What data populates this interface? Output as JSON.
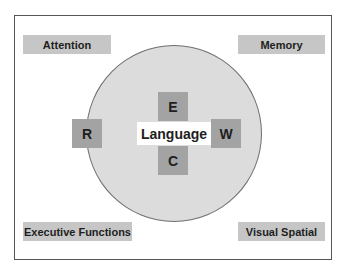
{
  "diagram": {
    "center": {
      "label": "Language"
    },
    "inner_boxes": {
      "top": "E",
      "left": "R",
      "right": "W",
      "bottom": "C"
    },
    "corners": {
      "top_left": "Attention",
      "top_right": "Memory",
      "bottom_left": "Executive Functions",
      "bottom_right": "Visual Spatial"
    },
    "colors": {
      "frame_border": "#555555",
      "circle_fill": "#dcdcdc",
      "circle_border": "#6f6f6f",
      "label_box": "#c6c6c6",
      "letter_box": "#a3a3a3",
      "center_box": "#ffffff",
      "text": "#1e1e1e"
    }
  }
}
